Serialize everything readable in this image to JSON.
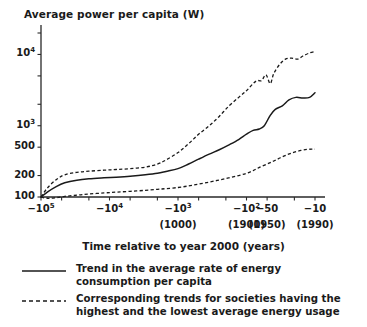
{
  "chart_data": {
    "type": "line",
    "title": "Average power per capita (W)",
    "xlabel": "Time relative to year 2000 (years)",
    "ylabel": "Average power per capita (W)",
    "y_scale": "log",
    "x_scale": "negative-log",
    "ylim": [
      90,
      20000
    ],
    "ytick_labels": [
      "10",
      "10",
      "500",
      "200",
      "100"
    ],
    "yticks": [
      {
        "label": "10^4",
        "base": "10",
        "exp": "4",
        "value": 10000
      },
      {
        "label": "10^3",
        "base": "10",
        "exp": "3",
        "value": 1000
      },
      {
        "label": "500",
        "base": "500",
        "exp": "",
        "value": 500
      },
      {
        "label": "200",
        "base": "200",
        "exp": "",
        "value": 200
      },
      {
        "label": "100",
        "base": "100",
        "exp": "",
        "value": 100
      }
    ],
    "xticks": [
      {
        "label": "-10^5",
        "base": "−10",
        "exp": "5",
        "sub": "",
        "value": -100000
      },
      {
        "label": "-10^4",
        "base": "−10",
        "exp": "4",
        "sub": "",
        "value": -10000
      },
      {
        "label": "-10^3",
        "base": "−10",
        "exp": "3",
        "sub": "(1000)",
        "value": -1000
      },
      {
        "label": "-10^2",
        "base": "−10",
        "exp": "2",
        "sub": "(1900)",
        "value": -100
      },
      {
        "label": "-50",
        "base": "−50",
        "exp": "",
        "sub": "(1950)",
        "value": -50
      },
      {
        "label": "-10",
        "base": "−10",
        "exp": "",
        "sub": "(1990)",
        "value": -10
      }
    ],
    "series": [
      {
        "name": "Trend in the average rate of energy consumption per capita",
        "style": "solid",
        "points": [
          [
            -100000,
            100
          ],
          [
            -80000,
            118
          ],
          [
            -60000,
            140
          ],
          [
            -45000,
            158
          ],
          [
            -30000,
            172
          ],
          [
            -20000,
            180
          ],
          [
            -12000,
            186
          ],
          [
            -8000,
            190
          ],
          [
            -5000,
            196
          ],
          [
            -3000,
            205
          ],
          [
            -2000,
            215
          ],
          [
            -1500,
            228
          ],
          [
            -1000,
            250
          ],
          [
            -700,
            290
          ],
          [
            -500,
            340
          ],
          [
            -350,
            400
          ],
          [
            -250,
            460
          ],
          [
            -180,
            540
          ],
          [
            -130,
            640
          ],
          [
            -100,
            760
          ],
          [
            -80,
            860
          ],
          [
            -65,
            900
          ],
          [
            -55,
            1000
          ],
          [
            -45,
            1400
          ],
          [
            -38,
            1700
          ],
          [
            -30,
            1900
          ],
          [
            -24,
            2300
          ],
          [
            -19,
            2500
          ],
          [
            -15,
            2450
          ],
          [
            -12,
            2500
          ],
          [
            -10,
            2900
          ]
        ]
      },
      {
        "name": "Highest average energy usage",
        "style": "dashed",
        "points": [
          [
            -100000,
            100
          ],
          [
            -80000,
            135
          ],
          [
            -60000,
            175
          ],
          [
            -45000,
            205
          ],
          [
            -30000,
            222
          ],
          [
            -20000,
            230
          ],
          [
            -12000,
            238
          ],
          [
            -8000,
            243
          ],
          [
            -5000,
            250
          ],
          [
            -3000,
            262
          ],
          [
            -2000,
            290
          ],
          [
            -1500,
            330
          ],
          [
            -1000,
            420
          ],
          [
            -700,
            560
          ],
          [
            -500,
            760
          ],
          [
            -350,
            1000
          ],
          [
            -250,
            1350
          ],
          [
            -180,
            1900
          ],
          [
            -130,
            2500
          ],
          [
            -100,
            3100
          ],
          [
            -80,
            3900
          ],
          [
            -70,
            4300
          ],
          [
            -60,
            4300
          ],
          [
            -52,
            5200
          ],
          [
            -45,
            3900
          ],
          [
            -40,
            5400
          ],
          [
            -33,
            7200
          ],
          [
            -27,
            8600
          ],
          [
            -22,
            8900
          ],
          [
            -18,
            8600
          ],
          [
            -15,
            9500
          ],
          [
            -12,
            10500
          ],
          [
            -10,
            11000
          ]
        ]
      },
      {
        "name": "Lowest average energy usage",
        "style": "dashed",
        "points": [
          [
            -100000,
            100
          ],
          [
            -80000,
            96
          ],
          [
            -60000,
            98
          ],
          [
            -45000,
            102
          ],
          [
            -30000,
            106
          ],
          [
            -20000,
            110
          ],
          [
            -12000,
            114
          ],
          [
            -8000,
            117
          ],
          [
            -5000,
            120
          ],
          [
            -3000,
            124
          ],
          [
            -2000,
            128
          ],
          [
            -1500,
            131
          ],
          [
            -1000,
            136
          ],
          [
            -700,
            143
          ],
          [
            -500,
            152
          ],
          [
            -350,
            162
          ],
          [
            -250,
            173
          ],
          [
            -180,
            186
          ],
          [
            -130,
            200
          ],
          [
            -100,
            215
          ],
          [
            -80,
            235
          ],
          [
            -65,
            260
          ],
          [
            -50,
            290
          ],
          [
            -40,
            320
          ],
          [
            -32,
            355
          ],
          [
            -25,
            395
          ],
          [
            -20,
            425
          ],
          [
            -16,
            450
          ],
          [
            -13,
            465
          ],
          [
            -11,
            470
          ],
          [
            -10,
            470
          ]
        ]
      }
    ],
    "legend_position": "bottom",
    "grid": false,
    "legend": [
      {
        "key": "solid-line",
        "text": "Trend in the average rate of energy consumption per capita"
      },
      {
        "key": "dashed-line",
        "text": "Corresponding trends for societies having the highest and the lowest average energy usage"
      }
    ]
  }
}
